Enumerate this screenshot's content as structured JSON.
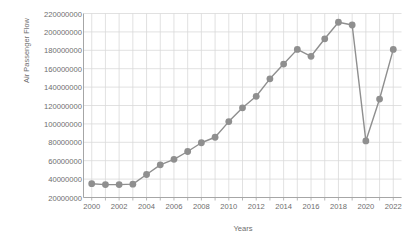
{
  "chart_data": {
    "type": "line",
    "title": "",
    "xlabel": "Years",
    "ylabel": "Air Passenger Flow",
    "x": [
      2000,
      2001,
      2002,
      2003,
      2004,
      2005,
      2006,
      2007,
      2008,
      2009,
      2010,
      2011,
      2012,
      2013,
      2014,
      2015,
      2016,
      2017,
      2018,
      2019,
      2020,
      2021,
      2022
    ],
    "values": [
      35000000,
      34000000,
      34000000,
      34500000,
      45000000,
      55500000,
      61500000,
      70000000,
      79500000,
      85500000,
      102500000,
      117500000,
      130000000,
      149000000,
      165000000,
      181000000,
      173500000,
      192500000,
      210500000,
      207500000,
      81500000,
      127000000,
      181000000
    ],
    "series": [
      {
        "name": "Air Passenger Flow",
        "values": [
          35000000,
          34000000,
          34000000,
          34500000,
          45000000,
          55500000,
          61500000,
          70000000,
          79500000,
          85500000,
          102500000,
          117500000,
          130000000,
          149000000,
          165000000,
          181000000,
          173500000,
          192500000,
          210500000,
          207500000,
          81500000,
          127000000,
          181000000
        ]
      }
    ],
    "xlim": [
      1999.4,
      2022.6
    ],
    "ylim": [
      20000000,
      220000000
    ],
    "ytick_step": 20000000,
    "yticks": [
      220000000,
      200000000,
      180000000,
      160000000,
      140000000,
      120000000,
      100000000,
      80000000,
      60000000,
      40000000,
      20000000
    ],
    "ytick_labels": [
      "220000000",
      "200000000",
      "180000000",
      "160000000",
      "140000000",
      "120000000",
      "100000000",
      "80000000",
      "60000000",
      "40000000",
      "20000000"
    ],
    "xticks": [
      2000,
      2002,
      2004,
      2006,
      2008,
      2010,
      2012,
      2014,
      2016,
      2018,
      2020,
      2022
    ],
    "xtick_labels": [
      "2000",
      "2002",
      "2004",
      "2006",
      "2008",
      "2010",
      "2012",
      "2014",
      "2016",
      "2018",
      "2020",
      "2022"
    ],
    "xtick_minor": [
      2001,
      2003,
      2005,
      2007,
      2009,
      2011,
      2013,
      2015,
      2017,
      2019,
      2021
    ],
    "grid": {
      "horizontal": true,
      "vertical": true,
      "color": "#d9d9d9"
    },
    "legend": {
      "visible": false,
      "position": "none"
    },
    "style": {
      "line_color": "#8f8f8f",
      "marker_color": "#8f8f8f",
      "marker_shape": "circle",
      "marker_size": 3.4,
      "line_width": 1.4,
      "axis_color": "#a6a6a6",
      "text_color": "#6e6e6e",
      "background": "#ffffff"
    }
  }
}
